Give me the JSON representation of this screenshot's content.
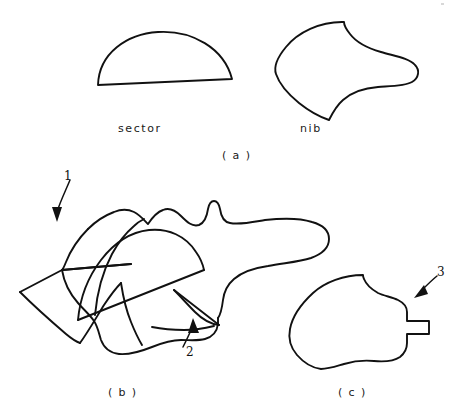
{
  "figure": {
    "width": 462,
    "height": 416,
    "background": "#ffffff",
    "ink_color": "#111111"
  },
  "labels": {
    "sector": "sector",
    "nib": "nib"
  },
  "captions": {
    "a": "( a )",
    "b": "( b )",
    "c": "( c )"
  },
  "callouts": {
    "one": "1",
    "two": "2",
    "three": "3"
  },
  "panels": [
    {
      "id": "a",
      "caption": "( a )",
      "shapes": [
        "sector",
        "nib"
      ]
    },
    {
      "id": "b",
      "caption": "( b )",
      "shapes": [
        "composite-overlap"
      ],
      "callouts": [
        "1",
        "2"
      ]
    },
    {
      "id": "c",
      "caption": "( c )",
      "shapes": [
        "trimmed-nib"
      ],
      "callouts": [
        "3"
      ]
    }
  ]
}
